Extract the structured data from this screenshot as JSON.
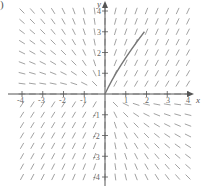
{
  "figure": {
    "panel_marker": ")",
    "axis_x_label": "x",
    "axis_y_label": "y",
    "x_ticks": [
      "-4",
      "-3",
      "-2",
      "-1",
      "1",
      "2",
      "3",
      "4"
    ],
    "y_ticks": [
      "4",
      "3",
      "2",
      "1",
      "-1",
      "-2",
      "-3",
      "-4"
    ],
    "x_range": [
      -4,
      4
    ],
    "y_range": [
      -4,
      4
    ],
    "grid_step": 0.5,
    "solution_curve": {
      "from": [
        0,
        0
      ],
      "to": [
        1.9,
        3.0
      ]
    },
    "colors": {
      "segments": "#8a8a8a",
      "axes": "#555555",
      "curve": "#777777"
    }
  }
}
